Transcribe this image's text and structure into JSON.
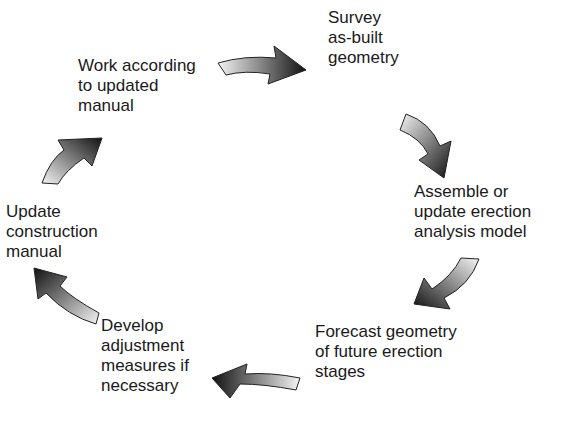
{
  "diagram": {
    "type": "cycle",
    "steps": [
      {
        "id": "survey",
        "text": "Survey\nas-built\ngeometry"
      },
      {
        "id": "assemble",
        "text": "Assemble or\nupdate erection\nanalysis model"
      },
      {
        "id": "forecast",
        "text": "Forecast geometry\nof future erection\nstages"
      },
      {
        "id": "develop",
        "text": "Develop\nadjustment\nmeasures if\nnecessary"
      },
      {
        "id": "update",
        "text": "Update\nconstruction\nmanual"
      },
      {
        "id": "work",
        "text": "Work according\nto updated\nmanual"
      }
    ],
    "arrows": [
      {
        "from": "work",
        "to": "survey"
      },
      {
        "from": "survey",
        "to": "assemble"
      },
      {
        "from": "assemble",
        "to": "forecast"
      },
      {
        "from": "forecast",
        "to": "develop"
      },
      {
        "from": "develop",
        "to": "update"
      },
      {
        "from": "update",
        "to": "work"
      }
    ],
    "colors": {
      "text": "#1a1a1a",
      "arrow_light": "#f2f2f2",
      "arrow_dark": "#111111",
      "background": "#ffffff"
    }
  }
}
